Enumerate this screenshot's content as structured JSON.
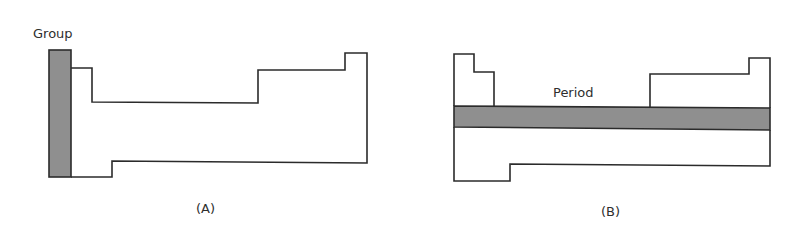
{
  "figure": {
    "panels": [
      {
        "id": "A",
        "caption": "(A)",
        "highlight_label": "Group",
        "highlight_type": "vertical column",
        "description": "Periodic table outline with leftmost vertical column shaded"
      },
      {
        "id": "B",
        "caption": "(B)",
        "highlight_label": "Period",
        "highlight_type": "horizontal row",
        "description": "Periodic table outline with a horizontal row band shaded"
      }
    ],
    "colors": {
      "outline": "#2b2b2b",
      "shading": "#8f8f8f",
      "background": "#ffffff"
    }
  }
}
